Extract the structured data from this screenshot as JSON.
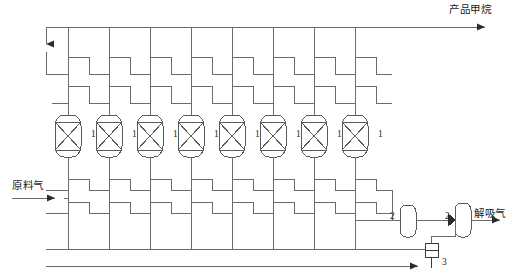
{
  "diagram": {
    "canvas": {
      "width": 514,
      "height": 276
    },
    "line_color": "#6b6b6b",
    "stroke_color": "#4a4a4a",
    "text_color": "#1a1a1a",
    "background": "#ffffff"
  },
  "streams": [
    {
      "id": "product",
      "label": "产品甲烷",
      "x": 449,
      "y": 11,
      "direction": "right"
    },
    {
      "id": "feed",
      "label": "原料气",
      "x": 12,
      "y": 180,
      "direction": "right"
    },
    {
      "id": "desorption",
      "label": "解吸气",
      "x": 474,
      "y": 212,
      "direction": "right"
    }
  ],
  "adsorbers": {
    "tag": "1",
    "count": 8,
    "tag_positions": [
      {
        "x": 91,
        "y": 134
      },
      {
        "x": 132,
        "y": 134
      },
      {
        "x": 173,
        "y": 134
      },
      {
        "x": 214,
        "y": 134
      },
      {
        "x": 255,
        "y": 134
      },
      {
        "x": 296,
        "y": 134
      },
      {
        "x": 337,
        "y": 134
      },
      {
        "x": 378,
        "y": 134
      }
    ],
    "column_x": [
      68,
      109,
      150,
      191,
      232,
      273,
      314,
      355
    ],
    "vessel_top": 115,
    "vessel_height": 42,
    "vessel_width": 26
  },
  "buffer_tanks": {
    "tag": "2",
    "count": 2,
    "items": [
      {
        "tag": "2",
        "tag_x": 392,
        "tag_y": 215,
        "vx": 400,
        "vy": 205,
        "w": 16,
        "h": 32
      },
      {
        "tag": "2",
        "tag_x": 447,
        "tag_y": 215,
        "vx": 455,
        "vy": 203,
        "w": 16,
        "h": 34
      }
    ]
  },
  "vacuum_pump": {
    "tag": "3",
    "tag_x": 442,
    "tag_y": 261,
    "bx": 425,
    "by": 243,
    "w": 13,
    "h": 14
  },
  "bus_lines": {
    "product_header_y": 27,
    "upper_manifold_y": [
      57,
      74
    ],
    "lower_manifold_y": [
      190,
      213
    ],
    "bottom_header_y": 249,
    "left_riser_x": 46,
    "header_left_x": 46,
    "header_right_x": 500,
    "feed_entry_y": 198,
    "desorb_y": 220
  }
}
